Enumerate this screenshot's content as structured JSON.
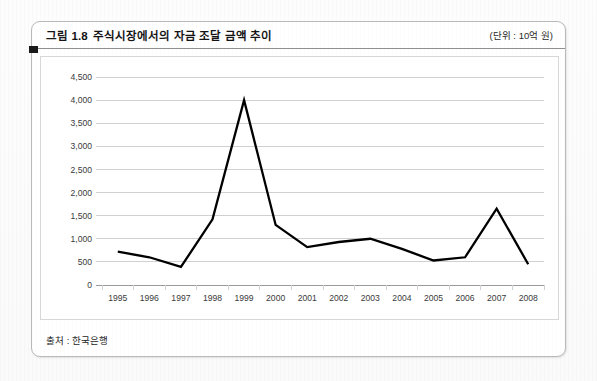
{
  "figure": {
    "number": "그림 1.8",
    "title": "주식시장에서의 자금 조달 금액 추이",
    "unit_note": "(단위 : 10억 원)",
    "source_note": "출처 : 한국은행"
  },
  "chart_data": {
    "type": "line",
    "title": "주식시장에서의 자금 조달 금액 추이",
    "xlabel": "",
    "ylabel": "",
    "unit": "10억 원",
    "categories": [
      "1995",
      "1996",
      "1997",
      "1998",
      "1999",
      "2000",
      "2001",
      "2002",
      "2003",
      "2004",
      "2005",
      "2006",
      "2007",
      "2008"
    ],
    "values": [
      720,
      600,
      390,
      1420,
      4000,
      1300,
      820,
      930,
      1000,
      780,
      530,
      600,
      1650,
      450
    ],
    "series": [
      {
        "name": "자금 조달 금액",
        "values": [
          720,
          600,
          390,
          1420,
          4000,
          1300,
          820,
          930,
          1000,
          780,
          530,
          600,
          1650,
          450
        ]
      }
    ],
    "ylim": [
      0,
      4500
    ],
    "ytick_values": [
      0,
      500,
      1000,
      1500,
      2000,
      2500,
      3000,
      3500,
      4000,
      4500
    ],
    "ytick_labels": [
      "0",
      "500",
      "1,000",
      "1,500",
      "2,000",
      "2,500",
      "3,000",
      "3,500",
      "4,000",
      "4,500"
    ],
    "grid": true,
    "grid_axis": "y",
    "legend": false,
    "line_color": "#000000",
    "grid_color": "#d0d0d0",
    "axis_color": "#9a9a9a",
    "plot_background": "#ffffff"
  }
}
